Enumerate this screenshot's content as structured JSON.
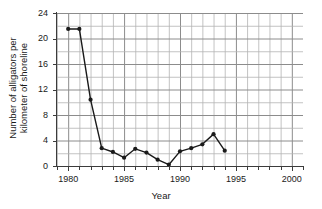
{
  "chart_data": {
    "type": "line",
    "title": "",
    "xlabel": "Year",
    "ylabel": "Number of alligators per\nkilometer of shoreline",
    "xlim": [
      1979,
      2001
    ],
    "ylim": [
      0,
      24
    ],
    "xticks": [
      1980,
      1985,
      1990,
      1995,
      2000
    ],
    "xtick_labels": [
      "1980",
      "1985",
      "1990",
      "1995",
      "2000"
    ],
    "yticks": [
      0,
      4,
      8,
      12,
      16,
      20,
      24
    ],
    "ytick_labels": [
      "0",
      "4",
      "8",
      "12",
      "16",
      "20",
      "24"
    ],
    "x_minor_step": 1,
    "y_minor_step": 2,
    "grid": true,
    "legend": null,
    "marker": "filled-circle",
    "line_color": "#1a1a1a",
    "grid_color": "#b4b4b4",
    "x": [
      1980,
      1981,
      1982,
      1983,
      1984,
      1985,
      1986,
      1987,
      1988,
      1989,
      1990,
      1991,
      1992,
      1993,
      1994
    ],
    "values": [
      21.5,
      21.5,
      10.4,
      2.8,
      2.2,
      1.3,
      2.7,
      2.1,
      1.0,
      0.2,
      2.3,
      2.8,
      3.4,
      5.0,
      2.4
    ],
    "series": [
      {
        "name": "Alligators per kilometer of shoreline",
        "values": [
          21.5,
          21.5,
          10.4,
          2.8,
          2.2,
          1.3,
          2.7,
          2.1,
          1.0,
          0.2,
          2.3,
          2.8,
          3.4,
          5.0,
          2.4
        ]
      }
    ]
  },
  "figure": {
    "top_sliver_text": "",
    "background_color": "#ffffff"
  }
}
